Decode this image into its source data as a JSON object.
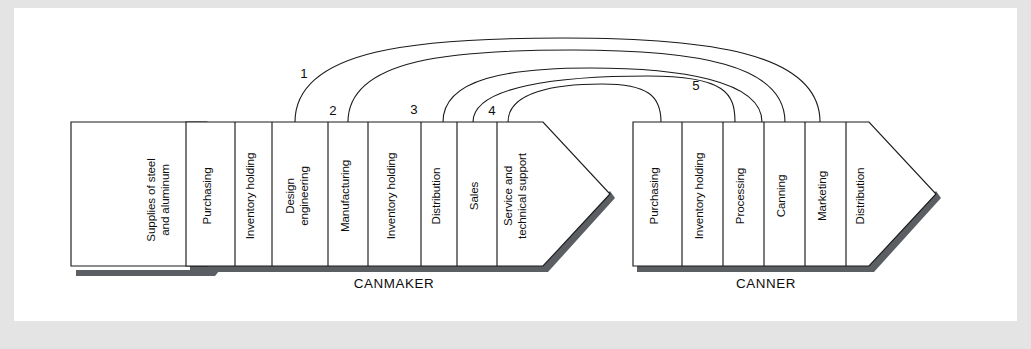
{
  "diagram": {
    "type": "value-chain",
    "supply": {
      "shape": "arrow-pentagon",
      "lines": [
        "Supplies of steel",
        "and aluminum"
      ]
    },
    "chains": [
      {
        "id": "canmaker",
        "group_label": "CANMAKER",
        "shape": "arrow-pentagon",
        "segments": [
          {
            "lines": [
              "Purchasing"
            ]
          },
          {
            "lines": [
              "Inventory holding"
            ]
          },
          {
            "lines": [
              "Design",
              "engineering"
            ]
          },
          {
            "lines": [
              "Manufacturing"
            ]
          },
          {
            "lines": [
              "Inventory holding"
            ]
          },
          {
            "lines": [
              "Distribution"
            ]
          },
          {
            "lines": [
              "Sales"
            ]
          },
          {
            "lines": [
              "Service and",
              "technical support"
            ]
          }
        ]
      },
      {
        "id": "canner",
        "group_label": "CANNER",
        "shape": "arrow-pentagon",
        "segments": [
          {
            "lines": [
              "Purchasing"
            ]
          },
          {
            "lines": [
              "Inventory holding"
            ]
          },
          {
            "lines": [
              "Processing"
            ]
          },
          {
            "lines": [
              "Canning"
            ]
          },
          {
            "lines": [
              "Marketing"
            ]
          },
          {
            "lines": [
              "Distribution"
            ]
          }
        ]
      }
    ],
    "linkages": [
      {
        "number": "1"
      },
      {
        "number": "2"
      },
      {
        "number": "3"
      },
      {
        "number": "4"
      },
      {
        "number": "5"
      }
    ],
    "colors": {
      "outline": "#1a1a1a",
      "fill": "#ffffff",
      "shadow": "#5b5f63",
      "page_edge": "#e4e4e4",
      "text": "#0d0d0d"
    }
  }
}
